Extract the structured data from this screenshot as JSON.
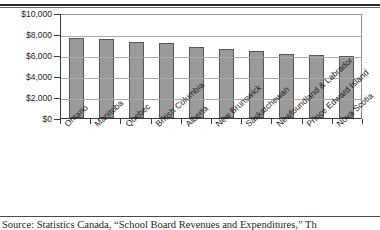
{
  "chart_data": {
    "type": "bar",
    "title": "",
    "xlabel": "",
    "ylabel": "",
    "ylim": [
      0,
      10000
    ],
    "ytick_labels": [
      "$10,000",
      "$8,000",
      "$6,000",
      "$4,000",
      "$2,000",
      "$0"
    ],
    "ytick_values": [
      10000,
      8000,
      6000,
      4000,
      2000,
      0
    ],
    "grid": true,
    "legend": "none",
    "categories": [
      "Ontario",
      "Manitoba",
      "Quebec",
      "British Columbia",
      "Alberta",
      "New Brunswick",
      "Saskatchewan",
      "Newfoundland & Labrador",
      "Prince Edward Island",
      "Nova Scotia"
    ],
    "values": [
      7650,
      7550,
      7200,
      7100,
      6750,
      6550,
      6400,
      6100,
      6000,
      5900
    ],
    "bar_color": "#9a9a9a",
    "bar_edge_color": "#555555"
  },
  "source_note": "Source: Statistics Canada, “School Board Revenues and Expenditures,” Th"
}
